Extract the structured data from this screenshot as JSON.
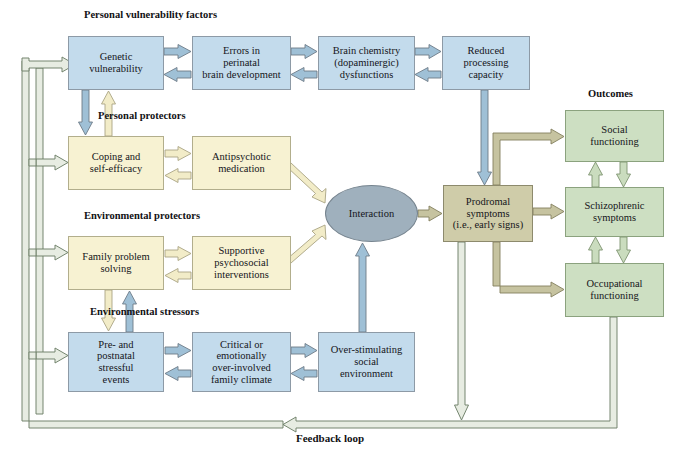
{
  "figure": {
    "caption": "Feedback loop"
  },
  "section_labels": [
    {
      "id": "personal-vulnerability",
      "text": "Personal vulnerability factors",
      "x": 84,
      "y": 9,
      "size": 10.5
    },
    {
      "id": "personal-protectors",
      "text": "Personal protectors",
      "x": 98,
      "y": 110,
      "size": 10.5
    },
    {
      "id": "environmental-protectors",
      "text": "Environmental protectors",
      "x": 84,
      "y": 210,
      "size": 10.5
    },
    {
      "id": "environmental-stressors",
      "text": "Environmental stressors",
      "x": 90,
      "y": 306,
      "size": 10.5
    },
    {
      "id": "outcomes",
      "text": "Outcomes",
      "x": 588,
      "y": 88,
      "size": 10.5
    }
  ],
  "nodes": [
    {
      "id": "genetic-vulnerability",
      "label": "Genetic\nvulnerability",
      "group": "personal-vulnerability",
      "color": "blue",
      "x": 68,
      "y": 36,
      "w": 96,
      "h": 54,
      "size": 10.5
    },
    {
      "id": "errors-perinatal",
      "label": "Errors in\nperinatal\nbrain development",
      "group": "personal-vulnerability",
      "color": "blue",
      "x": 192,
      "y": 36,
      "w": 99,
      "h": 54,
      "size": 10.5
    },
    {
      "id": "brain-chemistry",
      "label": "Brain chemistry\n(dopaminergic)\ndysfunctions",
      "group": "personal-vulnerability",
      "color": "blue",
      "x": 318,
      "y": 36,
      "w": 97,
      "h": 54,
      "size": 10.5
    },
    {
      "id": "reduced-processing",
      "label": "Reduced\nprocessing\ncapacity",
      "group": "personal-vulnerability",
      "color": "blue",
      "x": 442,
      "y": 36,
      "w": 88,
      "h": 54,
      "size": 10.5
    },
    {
      "id": "coping-self-efficacy",
      "label": "Coping and\nself-efficacy",
      "group": "personal-protectors",
      "color": "yellow",
      "x": 68,
      "y": 136,
      "w": 96,
      "h": 54,
      "size": 10.5
    },
    {
      "id": "antipsychotic-medication",
      "label": "Antipsychotic\nmedication",
      "group": "personal-protectors",
      "color": "yellow",
      "x": 192,
      "y": 136,
      "w": 99,
      "h": 54,
      "size": 10.5
    },
    {
      "id": "family-problem-solving",
      "label": "Family problem\nsolving",
      "group": "environmental-protectors",
      "color": "yellow",
      "x": 68,
      "y": 236,
      "w": 96,
      "h": 54,
      "size": 10.5
    },
    {
      "id": "supportive-psychosocial",
      "label": "Supportive\npsychosocial\ninterventions",
      "group": "environmental-protectors",
      "color": "yellow",
      "x": 192,
      "y": 236,
      "w": 99,
      "h": 54,
      "size": 10.5
    },
    {
      "id": "pre-postnatal-stress",
      "label": "Pre- and\npostnatal\nstressful\nevents",
      "group": "environmental-stressors",
      "color": "blue",
      "x": 68,
      "y": 332,
      "w": 96,
      "h": 60,
      "size": 10.5
    },
    {
      "id": "critical-family-climate",
      "label": "Critical or\nemotionally\nover-involved\nfamily climate",
      "group": "environmental-stressors",
      "color": "blue",
      "x": 192,
      "y": 332,
      "w": 99,
      "h": 60,
      "size": 10.5
    },
    {
      "id": "over-stimulating-environment",
      "label": "Over-stimulating\nsocial\nenvironment",
      "group": "environmental-stressors",
      "color": "blue",
      "x": 318,
      "y": 332,
      "w": 97,
      "h": 60,
      "size": 10.5
    },
    {
      "id": "prodromal-symptoms",
      "label": "Prodromal\nsymptoms\n(i.e., early signs)",
      "group": "mediator",
      "color": "tan",
      "x": 443,
      "y": 185,
      "w": 90,
      "h": 57,
      "size": 10.5
    },
    {
      "id": "social-functioning",
      "label": "Social\nfunctioning",
      "group": "outcomes",
      "color": "green",
      "x": 565,
      "y": 110,
      "w": 99,
      "h": 52,
      "size": 10.5
    },
    {
      "id": "schizophrenic-symptoms",
      "label": "Schizophrenic\nsymptoms",
      "group": "outcomes",
      "color": "green",
      "x": 565,
      "y": 187,
      "w": 99,
      "h": 50,
      "size": 10.5
    },
    {
      "id": "occupational-functioning",
      "label": "Occupational\nfunctioning",
      "group": "outcomes",
      "color": "green",
      "x": 565,
      "y": 263,
      "w": 99,
      "h": 54,
      "size": 10.5
    }
  ],
  "ellipse": {
    "id": "interaction",
    "label": "Interaction",
    "x": 325,
    "y": 185,
    "w": 93,
    "h": 57,
    "size": 10.5
  },
  "colors": {
    "blue_fill": "#c3dbec",
    "yellow_fill": "#f7f2d2",
    "green_fill": "#cddfc2",
    "tan_fill": "#cfcca9",
    "ellipse_fill": "#9fb0bd",
    "blue_arrow": "#8fb0c9",
    "yellow_arrow": "#efe8c0",
    "green_arrow": "#b7c9a8",
    "tan_arrow": "#b9b696",
    "feedback_arrow": "#8b9c84",
    "stroke": "#6f737a"
  },
  "edges": [
    {
      "id": "genetic-to-errors",
      "from": "genetic-vulnerability",
      "to": "errors-perinatal",
      "style": "blue"
    },
    {
      "id": "errors-to-genetic",
      "from": "errors-perinatal",
      "to": "genetic-vulnerability",
      "style": "blue"
    },
    {
      "id": "errors-to-brain",
      "from": "errors-perinatal",
      "to": "brain-chemistry",
      "style": "blue"
    },
    {
      "id": "brain-to-errors",
      "from": "brain-chemistry",
      "to": "errors-perinatal",
      "style": "blue"
    },
    {
      "id": "brain-to-reduced",
      "from": "brain-chemistry",
      "to": "reduced-processing",
      "style": "blue"
    },
    {
      "id": "reduced-to-brain",
      "from": "reduced-processing",
      "to": "brain-chemistry",
      "style": "blue"
    },
    {
      "id": "genetic-to-coping",
      "from": "genetic-vulnerability",
      "to": "coping-self-efficacy",
      "style": "blue"
    },
    {
      "id": "coping-to-genetic",
      "from": "coping-self-efficacy",
      "to": "genetic-vulnerability",
      "style": "yellow"
    },
    {
      "id": "coping-to-antipsychotic",
      "from": "coping-self-efficacy",
      "to": "antipsychotic-medication",
      "style": "yellow"
    },
    {
      "id": "antipsychotic-to-coping",
      "from": "antipsychotic-medication",
      "to": "coping-self-efficacy",
      "style": "yellow"
    },
    {
      "id": "family-to-supportive",
      "from": "family-problem-solving",
      "to": "supportive-psychosocial",
      "style": "yellow"
    },
    {
      "id": "supportive-to-family",
      "from": "supportive-psychosocial",
      "to": "family-problem-solving",
      "style": "yellow"
    },
    {
      "id": "family-to-prenatal",
      "from": "family-problem-solving",
      "to": "pre-postnatal-stress",
      "style": "yellow"
    },
    {
      "id": "prenatal-to-family",
      "from": "pre-postnatal-stress",
      "to": "family-problem-solving",
      "style": "blue"
    },
    {
      "id": "prenatal-to-critical",
      "from": "pre-postnatal-stress",
      "to": "critical-family-climate",
      "style": "blue"
    },
    {
      "id": "critical-to-prenatal",
      "from": "critical-family-climate",
      "to": "pre-postnatal-stress",
      "style": "blue"
    },
    {
      "id": "critical-to-overstim",
      "from": "critical-family-climate",
      "to": "over-stimulating-environment",
      "style": "blue"
    },
    {
      "id": "overstim-to-critical",
      "from": "over-stimulating-environment",
      "to": "critical-family-climate",
      "style": "blue"
    },
    {
      "id": "vulnerability-to-interaction",
      "from": "reduced-processing",
      "to": "interaction",
      "style": "blue"
    },
    {
      "id": "antipsychotic-to-interaction",
      "from": "antipsychotic-medication",
      "to": "interaction",
      "style": "yellow"
    },
    {
      "id": "supportive-to-interaction",
      "from": "supportive-psychosocial",
      "to": "interaction",
      "style": "yellow"
    },
    {
      "id": "overstim-to-interaction",
      "from": "over-stimulating-environment",
      "to": "interaction",
      "style": "blue"
    },
    {
      "id": "interaction-to-prodromal",
      "from": "interaction",
      "to": "prodromal-symptoms",
      "style": "tan"
    },
    {
      "id": "prodromal-to-social",
      "from": "prodromal-symptoms",
      "to": "social-functioning",
      "style": "tan"
    },
    {
      "id": "prodromal-to-schizophrenic",
      "from": "prodromal-symptoms",
      "to": "schizophrenic-symptoms",
      "style": "tan"
    },
    {
      "id": "prodromal-to-occupational",
      "from": "prodromal-symptoms",
      "to": "occupational-functioning",
      "style": "tan"
    },
    {
      "id": "schizophrenic-to-social",
      "from": "schizophrenic-symptoms",
      "to": "social-functioning",
      "style": "green"
    },
    {
      "id": "social-to-schizophrenic",
      "from": "social-functioning",
      "to": "schizophrenic-symptoms",
      "style": "green"
    },
    {
      "id": "occupational-to-schizophrenic",
      "from": "occupational-functioning",
      "to": "schizophrenic-symptoms",
      "style": "green"
    },
    {
      "id": "schizophrenic-to-occupational",
      "from": "schizophrenic-symptoms",
      "to": "occupational-functioning",
      "style": "green"
    },
    {
      "id": "occupational-feedback",
      "from": "occupational-functioning",
      "to": "feedback-bus",
      "style": "feedback"
    },
    {
      "id": "prodromal-feedback",
      "from": "prodromal-symptoms",
      "to": "feedback-bus",
      "style": "feedback"
    },
    {
      "id": "feedback-to-genetic",
      "from": "feedback-bus",
      "to": "genetic-vulnerability",
      "style": "feedback"
    },
    {
      "id": "feedback-to-coping",
      "from": "feedback-bus",
      "to": "coping-self-efficacy",
      "style": "feedback"
    },
    {
      "id": "feedback-to-family",
      "from": "feedback-bus",
      "to": "family-problem-solving",
      "style": "feedback"
    },
    {
      "id": "feedback-to-prenatal",
      "from": "feedback-bus",
      "to": "pre-postnatal-stress",
      "style": "feedback"
    }
  ]
}
